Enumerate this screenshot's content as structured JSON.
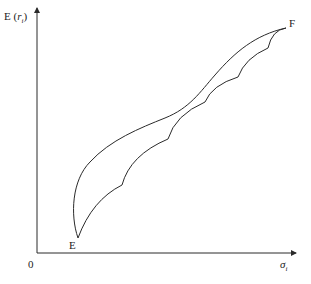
{
  "figure": {
    "y_axis_label": {
      "main": "E (",
      "var": "r",
      "sub": "i",
      "close": ")"
    },
    "x_axis_label": {
      "var": "σ",
      "sub": "i"
    },
    "origin_label": "0",
    "point_start": "E",
    "point_end": "F",
    "colors": {
      "line": "#2a2a2a",
      "background": "#ffffff"
    }
  },
  "curves": {
    "upper": "smooth S-shaped curve from E to F",
    "lower": "scalloped curve from E to F with 5 cusps"
  }
}
